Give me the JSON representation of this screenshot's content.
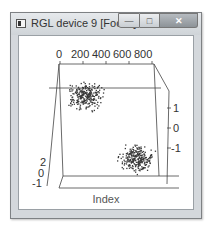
{
  "window": {
    "title": "RGL device 9 [Focus]",
    "buttons": {
      "minimize": "—",
      "maximize": "□",
      "close": "✕"
    }
  },
  "plot": {
    "top_axis_ticks": [
      "0",
      "200",
      "400",
      "600",
      "800"
    ],
    "right_axis_ticks": [
      "1",
      "0",
      "-1"
    ],
    "left_axis_ticks": [
      "2",
      "0",
      "-1"
    ],
    "xlabel": "Index"
  },
  "chart_data": {
    "type": "scatter",
    "title": "",
    "xlabel": "Index",
    "ylabel": "",
    "axes_3d": true,
    "x_range": [
      0,
      1000
    ],
    "x_ticks": [
      0,
      200,
      400,
      600,
      800
    ],
    "y_ticks": [
      -1,
      0,
      1
    ],
    "z_ticks": [
      -1,
      0,
      2
    ],
    "clusters": [
      {
        "name": "cluster-upper-left",
        "approx_points": 500,
        "location": "upper-left back"
      },
      {
        "name": "cluster-lower-right",
        "approx_points": 500,
        "location": "lower-right front"
      }
    ],
    "grid": false,
    "legend": null
  }
}
